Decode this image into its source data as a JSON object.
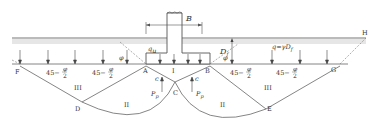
{
  "diagram": {
    "type": "bearing-capacity-failure-mechanism",
    "footing": {
      "width_label": "B",
      "pressure_label": "qu"
    },
    "surcharge": {
      "label": "q=γDf",
      "depth_label": "Df"
    },
    "points": [
      "A",
      "B",
      "C",
      "D",
      "E",
      "F",
      "G",
      "H"
    ],
    "zones": [
      "I",
      "II",
      "II",
      "III",
      "III"
    ],
    "angles": {
      "phi": "φ",
      "passive_angle": "45−φ/2"
    },
    "forces": {
      "passive": "Pp",
      "cohesion": "c"
    },
    "colors": {
      "line": "#555555",
      "ground": "#666666",
      "hatch": "#bbbbbb"
    }
  }
}
